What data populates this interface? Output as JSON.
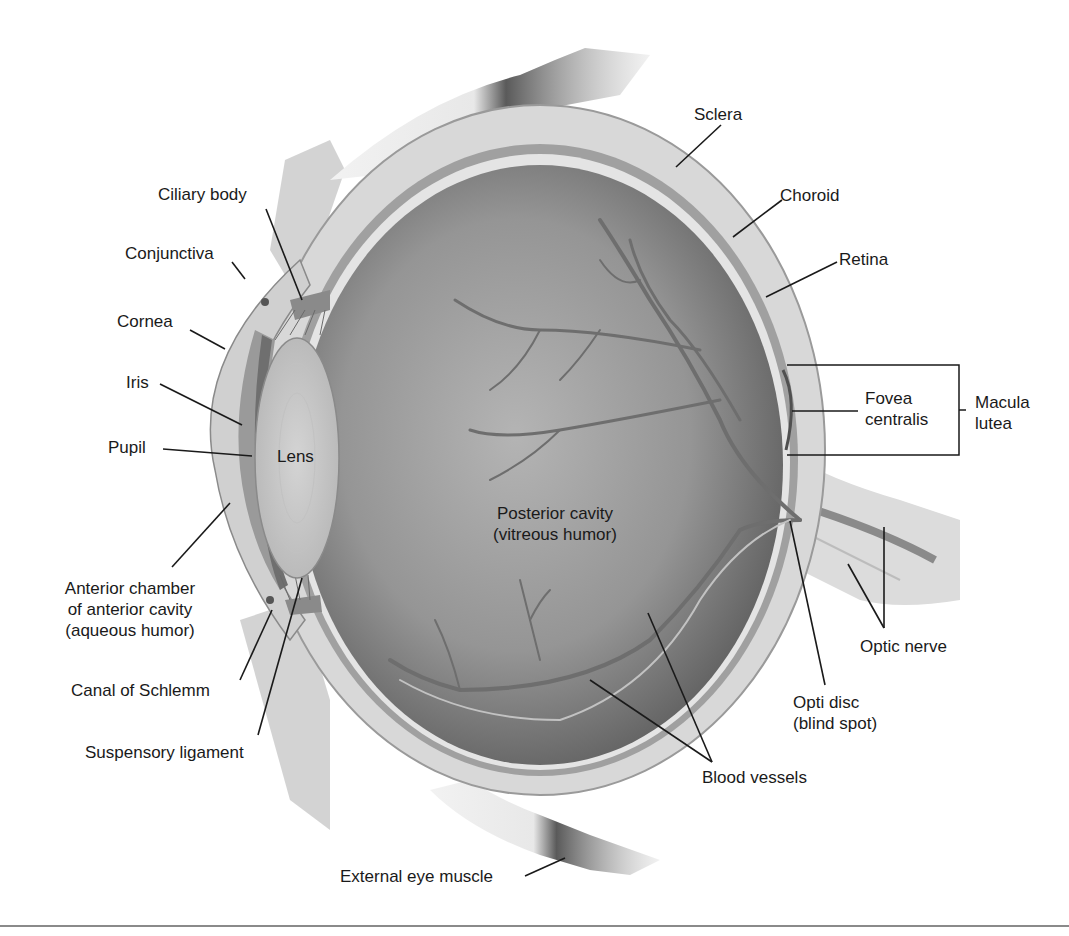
{
  "figure": {
    "colors": {
      "background": "#ffffff",
      "sclera": "#d6d6d6",
      "choroid": "#9a9a9a",
      "retina": "#e6e6e6",
      "vitreous": "#8c8c8c",
      "lens": "#c8c8c8",
      "vessels": "#6e6e6e",
      "leader_lines": "#1a1a1a",
      "text": "#1a1a1a"
    }
  },
  "labels": {
    "sclera": "Sclera",
    "choroid": "Choroid",
    "retina": "Retina",
    "fovea_line1": "Fovea",
    "fovea_line2": "centralis",
    "macula_line1": "Macula",
    "macula_line2": "lutea",
    "ciliary_body": "Ciliary body",
    "conjunctiva": "Conjunctiva",
    "cornea": "Cornea",
    "iris": "Iris",
    "pupil": "Pupil",
    "lens": "Lens",
    "posterior_line1": "Posterior cavity",
    "posterior_line2": "(vitreous humor)",
    "anterior_line1": "Anterior chamber",
    "anterior_line2": "of anterior cavity",
    "anterior_line3": "(aqueous humor)",
    "canal_of_schlemm": "Canal of Schlemm",
    "suspensory_ligament": "Suspensory ligament",
    "optic_nerve": "Optic nerve",
    "optic_disc_line1": "Opti disc",
    "optic_disc_line2": "(blind spot)",
    "blood_vessels": "Blood vessels",
    "external_eye_muscle": "External eye muscle"
  }
}
